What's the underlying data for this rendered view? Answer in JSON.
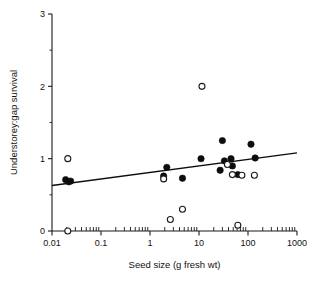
{
  "chart_data": {
    "type": "scatter",
    "title": "",
    "xlabel": "Seed size (g fresh wt)",
    "ylabel": "Understorey:gap survival",
    "xscale": "log",
    "yscale": "linear",
    "xlim": [
      0.01,
      1000
    ],
    "ylim": [
      0,
      3
    ],
    "grid": false,
    "legend_position": "none",
    "x_tick_labels": [
      "0.01",
      "0.1",
      "1",
      "10",
      "100",
      "1000"
    ],
    "x_tick_values": [
      0.01,
      0.1,
      1,
      10,
      100,
      1000
    ],
    "y_tick_labels": [
      "0",
      "1",
      "2",
      "3"
    ],
    "y_tick_values": [
      0,
      1,
      2,
      3
    ],
    "y_minor_ticks": [
      0.5,
      1.5,
      2.5
    ],
    "series": [
      {
        "name": "filled-circles",
        "marker": "filled circle",
        "color": "#0d0d0d",
        "points": [
          {
            "x": 0.019,
            "y": 0.71
          },
          {
            "x": 0.022,
            "y": 0.68
          },
          {
            "x": 0.024,
            "y": 0.69
          },
          {
            "x": 1.9,
            "y": 0.76
          },
          {
            "x": 2.2,
            "y": 0.88
          },
          {
            "x": 4.6,
            "y": 0.73
          },
          {
            "x": 11.0,
            "y": 1.0
          },
          {
            "x": 27.0,
            "y": 0.84
          },
          {
            "x": 30.0,
            "y": 1.25
          },
          {
            "x": 33.0,
            "y": 0.97
          },
          {
            "x": 45.0,
            "y": 1.0
          },
          {
            "x": 48.0,
            "y": 0.9
          },
          {
            "x": 62.0,
            "y": 0.78
          },
          {
            "x": 115.0,
            "y": 1.2
          },
          {
            "x": 140.0,
            "y": 1.01
          }
        ]
      },
      {
        "name": "open-circles",
        "marker": "open circle",
        "color": "#1a1a1a",
        "points": [
          {
            "x": 0.021,
            "y": 1.0
          },
          {
            "x": 0.021,
            "y": 0.0
          },
          {
            "x": 1.9,
            "y": 0.72
          },
          {
            "x": 2.6,
            "y": 0.16
          },
          {
            "x": 4.6,
            "y": 0.3
          },
          {
            "x": 11.5,
            "y": 2.0
          },
          {
            "x": 38.0,
            "y": 0.92
          },
          {
            "x": 48.0,
            "y": 0.78
          },
          {
            "x": 62.0,
            "y": 0.08
          },
          {
            "x": 75.0,
            "y": 0.77
          },
          {
            "x": 135.0,
            "y": 0.77
          }
        ]
      }
    ],
    "fit_line": {
      "name": "regression-line",
      "x_start": 0.01,
      "y_start": 0.63,
      "x_end": 1000,
      "y_end": 1.08
    }
  }
}
